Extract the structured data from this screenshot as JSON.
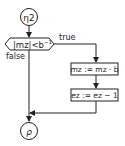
{
  "diagram": {
    "type": "flowchart",
    "start_node": {
      "label": "η2",
      "shape": "circle"
    },
    "decision": {
      "label_main": "|mz|<b",
      "label_sup": "−1",
      "shape": "hexagon"
    },
    "branches": {
      "true_label": "true",
      "false_label": "false"
    },
    "process_1": {
      "label": "mz := mz · b"
    },
    "process_2": {
      "label": "ez := ez − 1"
    },
    "end_node": {
      "label": "ρ",
      "shape": "circle"
    },
    "colors": {
      "stroke": "#222222",
      "background": "#ffffff"
    }
  }
}
